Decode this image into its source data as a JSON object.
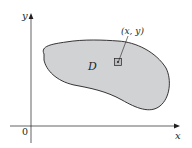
{
  "diagram": {
    "axes": {
      "x_label": "x",
      "y_label": "y",
      "origin_label": "0"
    },
    "region": {
      "label": "D",
      "fill_color": "#d1d2d4",
      "stroke_color": "#231f20"
    },
    "point": {
      "label": "(x, y)"
    },
    "colors": {
      "ink": "#231f20",
      "background": "#ffffff",
      "region_fill": "#d1d2d4"
    }
  }
}
